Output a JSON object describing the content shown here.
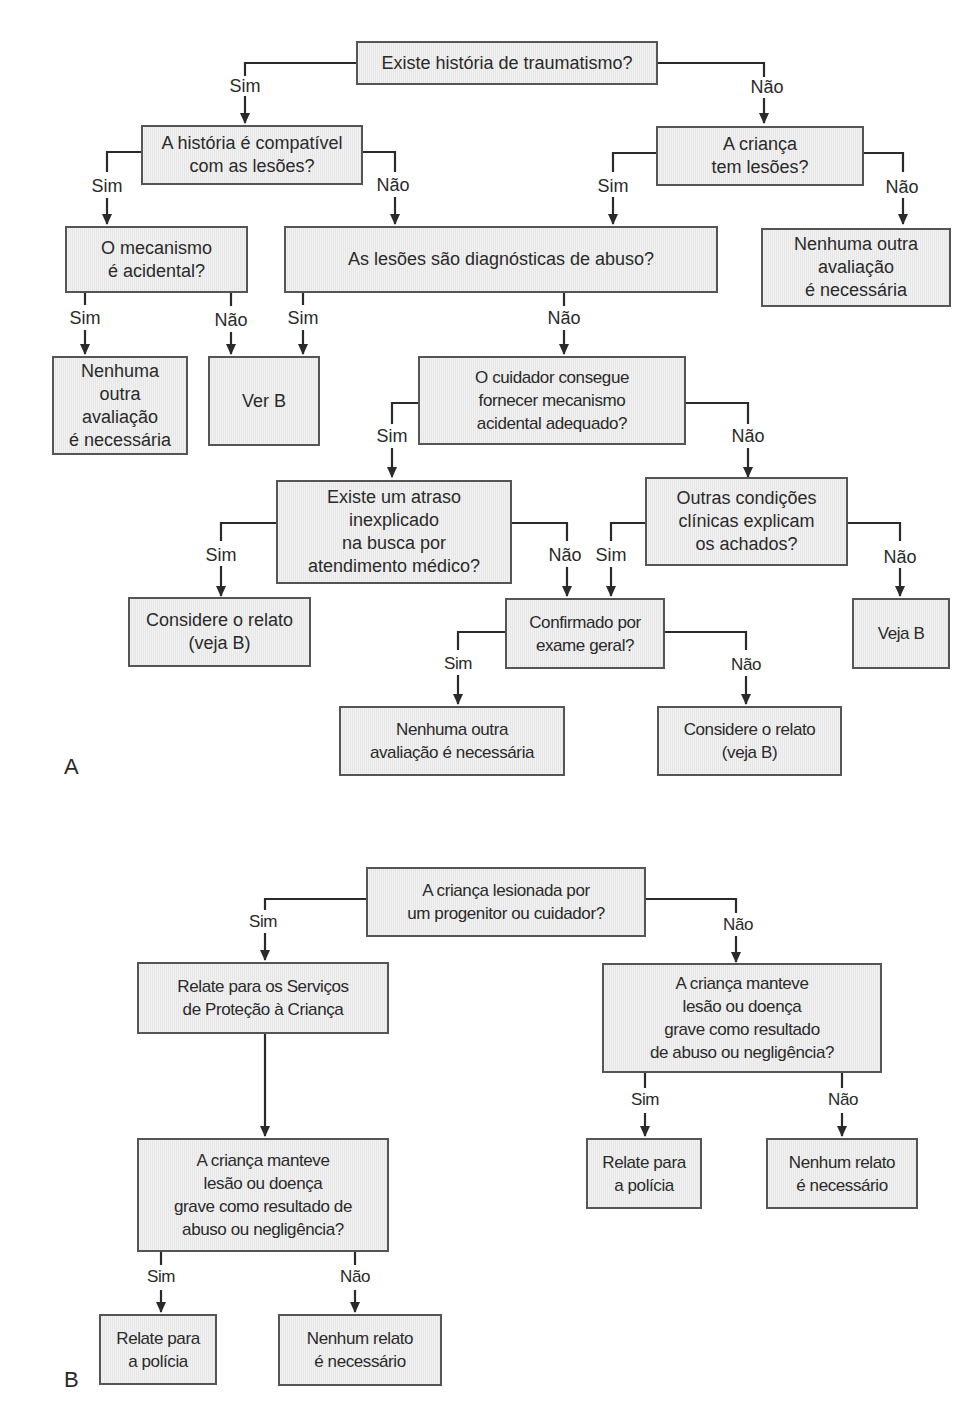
{
  "panel_a": {
    "letter": "A",
    "nodes": {
      "n1": "Existe história de traumatismo?",
      "n2": "A história é compatível\ncom as lesões?",
      "n3": "A criança\ntem lesões?",
      "n4": "O mecanismo\né acidental?",
      "n5": "As lesões são diagnósticas de abuso?",
      "n6": "Nenhuma outra\navaliação\né necessária",
      "n7": "Nenhuma\noutra\navaliação\né necessária",
      "n8": "Ver B",
      "n9": "O cuidador consegue\nfornecer mecanismo\nacidental adequado?",
      "n10": "Existe um atraso\ninexplicado\nna busca por\natendimento médico?",
      "n11": "Outras condições\nclínicas explicam\nos achados?",
      "n12": "Considere o relato\n(veja B)",
      "n13": "Confirmado por\nexame geral?",
      "n14": "Veja B",
      "n15": "Nenhuma outra\navaliação é necessária",
      "n16": "Considere o relato\n(veja B)"
    },
    "edge_labels": {
      "n1_sim": "Sim",
      "n1_nao": "Não",
      "n2_sim": "Sim",
      "n2_nao": "Não",
      "n3_sim": "Sim",
      "n3_nao": "Não",
      "n4_sim": "Sim",
      "n4_nao": "Não",
      "n5_sim": "Sim",
      "n5_nao": "Não",
      "n9_sim": "Sim",
      "n9_nao": "Não",
      "n10_sim": "Sim",
      "n10_nao": "Não",
      "n11_sim": "Sim",
      "n11_nao": "Não",
      "n13_sim": "Sim",
      "n13_nao": "Não"
    }
  },
  "panel_b": {
    "letter": "B",
    "nodes": {
      "b1": "A criança lesionada por\num progenitor ou cuidador?",
      "b2": "Relate para os Serviços\nde Proteção à Criança",
      "b3": "A criança manteve\nlesão ou doença\ngrave como resultado\nde abuso ou negligência?",
      "b4": "A criança manteve\nlesão ou doença\ngrave como resultado de\nabuso ou negligência?",
      "b5": "Relate para\na polícia",
      "b6": "Nenhum relato\né necessário",
      "b7": "Relate para\na polícia",
      "b8": "Nenhum relato\né necessário"
    },
    "edge_labels": {
      "b1_sim": "Sim",
      "b1_nao": "Não",
      "b3_sim": "Sim",
      "b3_nao": "Não",
      "b4_sim": "Sim",
      "b4_nao": "Não"
    }
  },
  "colors": {
    "box_fill": "#ebebeb",
    "box_border": "#555555",
    "line": "#2a2a2a"
  }
}
